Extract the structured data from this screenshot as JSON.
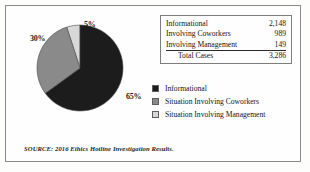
{
  "chart_data": {
    "type": "pie",
    "title": "",
    "categories": [
      "Informational",
      "Situation Involving Coworkers",
      "Situation Involving Management"
    ],
    "values": [
      2148,
      989,
      149
    ],
    "percent_labels": [
      "65%",
      "30%",
      "5%"
    ],
    "percents": [
      65,
      30,
      5
    ],
    "colors": [
      "#1c1c1c",
      "#8a8a8a",
      "#d8d8d8"
    ],
    "legend_position": "right",
    "grid": false,
    "start_angle_deg": 0,
    "direction": "clockwise",
    "source": "SOURCE: 2016 Ethics Hotline Investigation Results."
  },
  "table": {
    "rows": [
      {
        "label": "Informational",
        "value": "2,148"
      },
      {
        "label": "Involving Coworkers",
        "value": "989"
      },
      {
        "label": "Involving Management",
        "value": "149"
      }
    ],
    "total": {
      "label": "Total Cases",
      "value": "3,286"
    }
  },
  "legend": {
    "items": [
      {
        "label": "Informational",
        "color": "#1c1c1c"
      },
      {
        "label": "Situation Involving Coworkers",
        "color": "#8a8a8a"
      },
      {
        "label": "Situation Involving Management",
        "color": "#d8d8d8"
      }
    ]
  },
  "source_note": "SOURCE: 2016 Ethics Hotline Investigation Results."
}
